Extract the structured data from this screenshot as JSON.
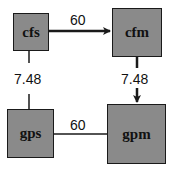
{
  "nodes": {
    "cfs": {
      "label": "cfs"
    },
    "cfm": {
      "label": "cfm"
    },
    "gps": {
      "label": "gps"
    },
    "gpm": {
      "label": "gpm"
    }
  },
  "edges": [
    {
      "from": "cfs",
      "to": "cfm",
      "label": "60",
      "directed": true
    },
    {
      "from": "cfm",
      "to": "gpm",
      "label": "7.48",
      "directed": true
    },
    {
      "from": "cfs",
      "to": "gps",
      "label": "7.48",
      "directed": false
    },
    {
      "from": "gps",
      "to": "gpm",
      "label": "60",
      "directed": false
    }
  ],
  "colors": {
    "box_fill": "#8a8a8a",
    "stroke": "#1a1a1a"
  }
}
